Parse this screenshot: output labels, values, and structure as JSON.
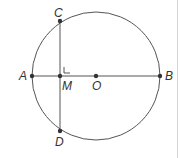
{
  "diagram": {
    "type": "circle-geometry",
    "colors": {
      "stroke": "#555555",
      "point": "#333333",
      "label": "#333333",
      "divider": "#d6d6d6"
    },
    "circle": {
      "center": "O",
      "cx": 96,
      "cy": 76,
      "r": 64
    },
    "points": [
      {
        "id": "A",
        "label": "A",
        "x": 32,
        "y": 76
      },
      {
        "id": "B",
        "label": "B",
        "x": 160,
        "y": 76
      },
      {
        "id": "C",
        "label": "C",
        "x": 60,
        "y": 21
      },
      {
        "id": "D",
        "label": "D",
        "x": 60,
        "y": 131
      },
      {
        "id": "M",
        "label": "M",
        "x": 60,
        "y": 76
      },
      {
        "id": "O",
        "label": "O",
        "x": 96,
        "y": 76
      }
    ],
    "segments": [
      {
        "from": "A",
        "to": "B",
        "name": "diameter-AB"
      },
      {
        "from": "C",
        "to": "D",
        "name": "chord-CD"
      }
    ],
    "right_angle_at": "M",
    "labels": {
      "A": "A",
      "B": "B",
      "C": "C",
      "D": "D",
      "M": "M",
      "O": "O"
    }
  }
}
